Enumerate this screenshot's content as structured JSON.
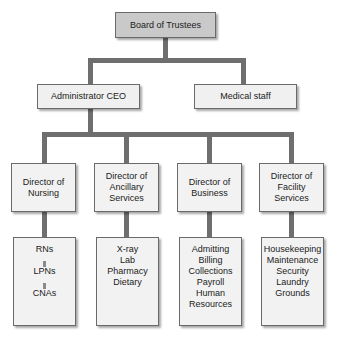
{
  "diagram": {
    "type": "org-chart",
    "colors": {
      "top_box_fill": "#c9c9c9",
      "box_fill": "#f2f2f2",
      "box_border": "#6a6a6a",
      "connector": "#6e6e6e",
      "text": "#1b1b1b",
      "background": "#ffffff"
    },
    "nodes": {
      "board": {
        "label": "Board of Trustees"
      },
      "administrator": {
        "label": "Administrator CEO"
      },
      "medical_staff": {
        "label": "Medical staff"
      },
      "director_nursing": {
        "line1": "Director of",
        "line2": "Nursing"
      },
      "director_ancillary": {
        "line1": "Director of",
        "line2": "Ancillary",
        "line3": "Services"
      },
      "director_business": {
        "line1": "Director of",
        "line2": "Business"
      },
      "director_facility": {
        "line1": "Director of",
        "line2": "Facility",
        "line3": "Services"
      }
    },
    "leaves": {
      "nursing": {
        "items": [
          "RNs",
          "LPNs",
          "CNAs"
        ]
      },
      "ancillary": {
        "items": [
          "X-ray",
          "Lab",
          "Pharmacy",
          "Dietary"
        ]
      },
      "business": {
        "items": [
          "Admitting",
          "Billing",
          "Collections",
          "Payroll",
          "Human Resources"
        ]
      },
      "facility": {
        "items": [
          "Housekeeping",
          "Maintenance",
          "Security",
          "Laundry",
          "Grounds"
        ]
      }
    }
  }
}
